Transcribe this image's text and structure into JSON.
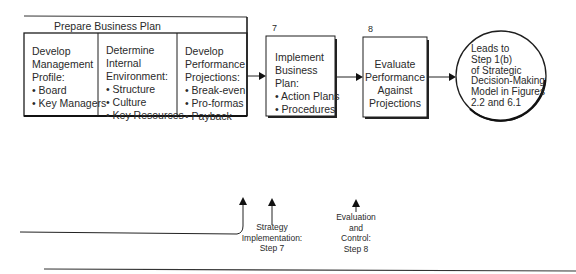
{
  "prepare_plan": {
    "title": "Prepare Business Plan",
    "columns": [
      {
        "lines": [
          "Develop",
          "Management",
          "Profile:",
          "• Board",
          "• Key Managers"
        ]
      },
      {
        "lines": [
          "Determine",
          "Internal",
          "Environment:",
          "• Structure",
          "• Culture",
          "• Key Resources"
        ]
      },
      {
        "lines": [
          "Develop",
          "Performance",
          "Projections:",
          "• Break-even",
          "• Pro-formas",
          "• Payback"
        ]
      }
    ]
  },
  "step7": {
    "number": "7",
    "lines": [
      "Implement",
      "Business",
      "Plan:",
      "• Action Plans",
      "• Procedures"
    ]
  },
  "step8": {
    "number": "8",
    "lines": [
      "Evaluate",
      "Performance",
      "Against",
      "Projections"
    ]
  },
  "circle": {
    "lines": [
      "Leads to",
      "Step 1(b)",
      "of Strategic",
      "Decision-Making",
      "Model in Figures",
      "2.2 and 6.1"
    ]
  },
  "bottom_labels": {
    "strategy_impl": [
      "Strategy",
      "Implementation:",
      "Step 7"
    ],
    "evaluation": [
      "Evaluation",
      "and",
      "Control:",
      "Step 8"
    ]
  }
}
